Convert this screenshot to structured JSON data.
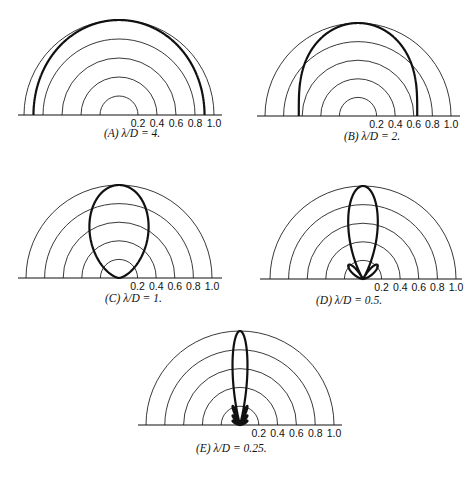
{
  "figure": {
    "tick_labels": [
      "0.2",
      "0.4",
      "0.6",
      "0.8",
      "1.0"
    ],
    "panels": [
      {
        "id": "A",
        "caption": "(A) λ/D = 4.",
        "lambda_over_d": 4,
        "cx": 119,
        "cy": 115,
        "r": 95,
        "line_x0": 18,
        "line_x1": 222,
        "label_x0": 136,
        "cap_x": 104,
        "cap_y": 137
      },
      {
        "id": "B",
        "caption": "(B) λ/D = 2.",
        "lambda_over_d": 2,
        "cx": 358,
        "cy": 116,
        "r": 93,
        "line_x0": 257,
        "line_x1": 460,
        "label_x0": 372,
        "cap_x": 344,
        "cap_y": 140
      },
      {
        "id": "C",
        "caption": "(C) λ/D = 1.",
        "lambda_over_d": 1,
        "cx": 119,
        "cy": 278,
        "r": 93,
        "line_x0": 18,
        "line_x1": 222,
        "label_x0": 134,
        "cap_x": 105,
        "cap_y": 302
      },
      {
        "id": "D",
        "caption": "(D) λ/D = 0.5.",
        "lambda_over_d": 0.5,
        "cx": 363,
        "cy": 279,
        "r": 93,
        "line_x0": 260,
        "line_x1": 462,
        "label_x0": 376,
        "cap_x": 316,
        "cap_y": 304
      },
      {
        "id": "E",
        "caption": "(E) λ/D = 0.25.",
        "lambda_over_d": 0.25,
        "cx": 240,
        "cy": 425,
        "r": 94,
        "line_x0": 138,
        "line_x1": 342,
        "label_x0": 254,
        "cap_x": 196,
        "cap_y": 452
      }
    ]
  },
  "chart_data": [
    {
      "type": "polar",
      "title": "(A) λ/D = 4.",
      "radial_ticks": [
        0.2,
        0.4,
        0.6,
        0.8,
        1.0
      ],
      "angle_range_deg": [
        0,
        180
      ],
      "pattern": "uniform aperture |sin(πD/λ·cosθ)/(πD/λ·cosθ)|",
      "lambda_over_d": 4
    },
    {
      "type": "polar",
      "title": "(B) λ/D = 2.",
      "radial_ticks": [
        0.2,
        0.4,
        0.6,
        0.8,
        1.0
      ],
      "angle_range_deg": [
        0,
        180
      ],
      "pattern": "uniform aperture",
      "lambda_over_d": 2
    },
    {
      "type": "polar",
      "title": "(C) λ/D = 1.",
      "radial_ticks": [
        0.2,
        0.4,
        0.6,
        0.8,
        1.0
      ],
      "angle_range_deg": [
        0,
        180
      ],
      "pattern": "uniform aperture",
      "lambda_over_d": 1
    },
    {
      "type": "polar",
      "title": "(D) λ/D = 0.5.",
      "radial_ticks": [
        0.2,
        0.4,
        0.6,
        0.8,
        1.0
      ],
      "angle_range_deg": [
        0,
        180
      ],
      "pattern": "uniform aperture",
      "lambda_over_d": 0.5
    },
    {
      "type": "polar",
      "title": "(E) λ/D = 0.25.",
      "radial_ticks": [
        0.2,
        0.4,
        0.6,
        0.8,
        1.0
      ],
      "angle_range_deg": [
        0,
        180
      ],
      "pattern": "uniform aperture",
      "lambda_over_d": 0.25
    }
  ]
}
